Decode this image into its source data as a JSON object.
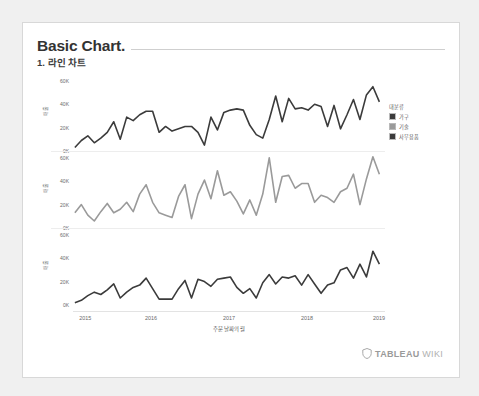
{
  "header": {
    "title": "Basic Chart.",
    "subtitle": "1. 라인 차트"
  },
  "legend": {
    "title": "대분류",
    "items": [
      {
        "label": "가구",
        "color": "#3b3b3b"
      },
      {
        "label": "기술",
        "color": "#9a9a9a"
      },
      {
        "label": "사무용품",
        "color": "#3b3b3b"
      }
    ]
  },
  "brand": {
    "name": "TABLEAU",
    "suffix": "WIKI",
    "icon": "shield-icon"
  },
  "chart_data": {
    "type": "line",
    "title": "",
    "xlabel": "주문 날짜의 월",
    "ylabel": "매출",
    "ylim": [
      0,
      65000
    ],
    "yticks": [
      "0K",
      "20K",
      "40K",
      "60K"
    ],
    "ytick_values": [
      0,
      20000,
      40000,
      60000
    ],
    "xticks": [
      "2015",
      "2016",
      "2017",
      "2018",
      "2019"
    ],
    "xtick_values": [
      2015,
      2016,
      2017,
      2018,
      2019
    ],
    "xlim": [
      2015,
      2019
    ],
    "grid": false,
    "legend_position": "right",
    "panel_layout": "vertical-small-multiples",
    "x": [
      "2015-01",
      "2015-02",
      "2015-03",
      "2015-04",
      "2015-05",
      "2015-06",
      "2015-07",
      "2015-08",
      "2015-09",
      "2015-10",
      "2015-11",
      "2015-12",
      "2016-01",
      "2016-02",
      "2016-03",
      "2016-04",
      "2016-05",
      "2016-06",
      "2016-07",
      "2016-08",
      "2016-09",
      "2016-10",
      "2016-11",
      "2016-12",
      "2017-01",
      "2017-02",
      "2017-03",
      "2017-04",
      "2017-05",
      "2017-06",
      "2017-07",
      "2017-08",
      "2017-09",
      "2017-10",
      "2017-11",
      "2017-12",
      "2018-01",
      "2018-02",
      "2018-03",
      "2018-04",
      "2018-05",
      "2018-06",
      "2018-07",
      "2018-08",
      "2018-09",
      "2018-10",
      "2018-11",
      "2018-12"
    ],
    "series": [
      {
        "name": "가구",
        "color": "#3b3b3b",
        "panel": 1,
        "values": [
          3000,
          9000,
          13000,
          7000,
          11000,
          16000,
          25000,
          10000,
          29000,
          26000,
          31000,
          34000,
          34000,
          16000,
          21000,
          17000,
          19000,
          21000,
          21000,
          16000,
          5000,
          29000,
          18000,
          33000,
          35000,
          36000,
          35000,
          22000,
          14000,
          11000,
          27000,
          47000,
          25000,
          45000,
          36000,
          37000,
          35000,
          40000,
          38000,
          21000,
          39000,
          19000,
          31000,
          44000,
          27000,
          48000,
          55000,
          42000
        ]
      },
      {
        "name": "기술",
        "color": "#9a9a9a",
        "panel": 2,
        "values": [
          13000,
          20000,
          11000,
          6000,
          14000,
          21000,
          13000,
          16000,
          22000,
          14000,
          29000,
          37000,
          22000,
          13000,
          11000,
          9000,
          27000,
          37000,
          8000,
          29000,
          41000,
          25000,
          49000,
          28000,
          31000,
          23000,
          12000,
          24000,
          11000,
          29000,
          60000,
          22000,
          44000,
          45000,
          34000,
          38000,
          38000,
          22000,
          28000,
          26000,
          22000,
          31000,
          34000,
          46000,
          20000,
          42000,
          61000,
          46000
        ]
      },
      {
        "name": "사무용품",
        "color": "#3b3b3b",
        "panel": 3,
        "values": [
          2000,
          4000,
          8000,
          11000,
          9000,
          13000,
          18000,
          6000,
          11000,
          15000,
          17000,
          23000,
          14000,
          5000,
          5000,
          5000,
          14000,
          21000,
          6000,
          22000,
          20000,
          16000,
          22000,
          23000,
          24000,
          15000,
          10000,
          14000,
          6000,
          19000,
          26000,
          18000,
          24000,
          23000,
          25000,
          17000,
          26000,
          18000,
          10000,
          17000,
          19000,
          30000,
          32000,
          23000,
          35000,
          24000,
          46000,
          35000
        ]
      }
    ]
  }
}
